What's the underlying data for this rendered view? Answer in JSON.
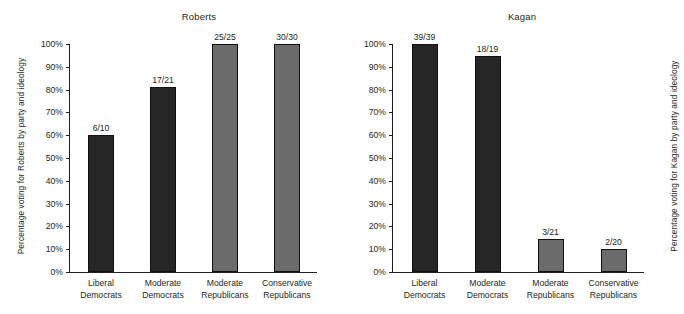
{
  "figure": {
    "background": "#ffffff",
    "text_color": "#231f20"
  },
  "colors": {
    "democrat_bar": "#262626",
    "republican_bar": "#6b6b6b",
    "axis": "#231f20"
  },
  "axis_ticks": [
    "0%",
    "10%",
    "20%",
    "30%",
    "40%",
    "50%",
    "60%",
    "70%",
    "80%",
    "90%",
    "100%"
  ],
  "categories": [
    {
      "line1": "Liberal",
      "line2": "Democrats"
    },
    {
      "line1": "Moderate",
      "line2": "Democrats"
    },
    {
      "line1": "Moderate",
      "line2": "Republicans"
    },
    {
      "line1": "Conservative",
      "line2": "Republicans"
    }
  ],
  "panels": [
    {
      "title": "Roberts",
      "ylabel": "Percentage voting for Roberts by party and ideology",
      "bars": [
        {
          "label": "6/10",
          "value": 60.0,
          "color": "#262626"
        },
        {
          "label": "17/21",
          "value": 81.0,
          "color": "#262626"
        },
        {
          "label": "25/25",
          "value": 100.0,
          "color": "#6b6b6b"
        },
        {
          "label": "30/30",
          "value": 100.0,
          "color": "#6b6b6b"
        }
      ]
    },
    {
      "title": "Kagan",
      "ylabel": "Percentage voting for Kagan by party and ideology",
      "bars": [
        {
          "label": "39/39",
          "value": 100.0,
          "color": "#262626"
        },
        {
          "label": "18/19",
          "value": 94.7,
          "color": "#262626"
        },
        {
          "label": "3/21",
          "value": 14.3,
          "color": "#6b6b6b"
        },
        {
          "label": "2/20",
          "value": 10.0,
          "color": "#6b6b6b"
        }
      ]
    }
  ],
  "chart_data": {
    "type": "bar",
    "panels": [
      {
        "title": "Roberts",
        "xlabel": "",
        "ylabel": "Percentage voting for Roberts by party and ideology",
        "ylim": [
          0,
          100
        ],
        "ytick_labels": [
          "0%",
          "10%",
          "20%",
          "30%",
          "40%",
          "50%",
          "60%",
          "70%",
          "80%",
          "90%",
          "100%"
        ],
        "grid": false,
        "legend": "none",
        "categories": [
          "Liberal Democrats",
          "Moderate Democrats",
          "Moderate Republicans",
          "Conservative Republicans"
        ],
        "values": [
          60.0,
          81.0,
          100.0,
          100.0
        ],
        "data_labels": [
          "6/10",
          "17/21",
          "25/25",
          "30/30"
        ],
        "counts": [
          {
            "yes": 6,
            "total": 10
          },
          {
            "yes": 17,
            "total": 21
          },
          {
            "yes": 25,
            "total": 25
          },
          {
            "yes": 30,
            "total": 30
          }
        ],
        "bar_colors": [
          "#262626",
          "#262626",
          "#6b6b6b",
          "#6b6b6b"
        ]
      },
      {
        "title": "Kagan",
        "xlabel": "",
        "ylabel": "Percentage voting for Kagan by party and ideology",
        "ylim": [
          0,
          100
        ],
        "ytick_labels": [
          "0%",
          "10%",
          "20%",
          "30%",
          "40%",
          "50%",
          "60%",
          "70%",
          "80%",
          "90%",
          "100%"
        ],
        "grid": false,
        "legend": "none",
        "categories": [
          "Liberal Democrats",
          "Moderate Democrats",
          "Moderate Republicans",
          "Conservative Republicans"
        ],
        "values": [
          100.0,
          94.7,
          14.3,
          10.0
        ],
        "data_labels": [
          "39/39",
          "18/19",
          "3/21",
          "2/20"
        ],
        "counts": [
          {
            "yes": 39,
            "total": 39
          },
          {
            "yes": 18,
            "total": 19
          },
          {
            "yes": 3,
            "total": 21
          },
          {
            "yes": 2,
            "total": 20
          }
        ],
        "bar_colors": [
          "#262626",
          "#262626",
          "#6b6b6b",
          "#6b6b6b"
        ]
      }
    ]
  }
}
